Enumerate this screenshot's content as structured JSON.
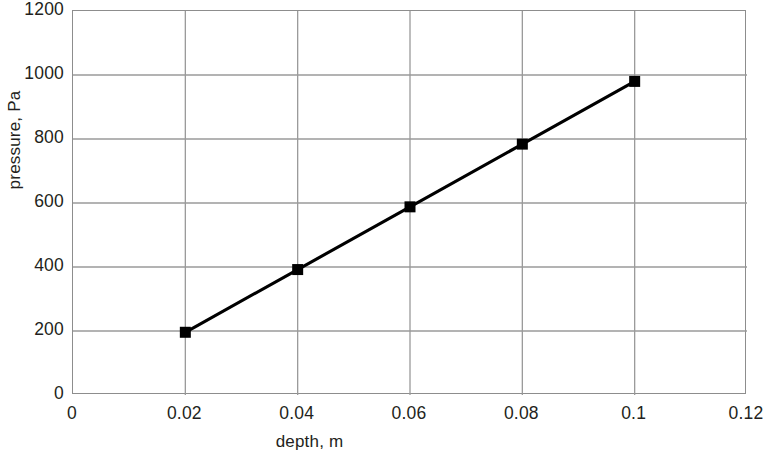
{
  "chart_data": {
    "type": "line",
    "title": "",
    "subtitle": "",
    "xlabel": "depth, m",
    "ylabel": "pressure, Pa",
    "x": [
      0.02,
      0.04,
      0.06,
      0.08,
      0.1
    ],
    "values": [
      196,
      392,
      588,
      784,
      980
    ],
    "series": [
      {
        "name": "pressure",
        "x": [
          0.02,
          0.04,
          0.06,
          0.08,
          0.1
        ],
        "values": [
          196,
          392,
          588,
          784,
          980
        ],
        "marker": "square",
        "marker_color": "#000000",
        "line_color": "#000000"
      }
    ],
    "xlim": [
      0,
      0.12
    ],
    "ylim": [
      0,
      1200
    ],
    "xticks": [
      0,
      0.02,
      0.04,
      0.06,
      0.08,
      0.1,
      0.12
    ],
    "xtick_labels": [
      "0",
      "0.02",
      "0.04",
      "0.06",
      "0.08",
      "0.1",
      "0.12"
    ],
    "yticks": [
      0,
      200,
      400,
      600,
      800,
      1000,
      1200
    ],
    "ytick_labels": [
      "0",
      "200",
      "400",
      "600",
      "800",
      "1000",
      "1200"
    ],
    "grid": "both",
    "grid_color": "#9a9a9a",
    "border_color": "#8d8d8d",
    "background": "#ffffff",
    "legend": "none",
    "annotations": []
  }
}
